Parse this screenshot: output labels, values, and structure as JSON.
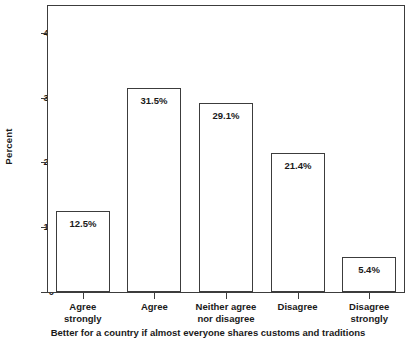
{
  "chart_data": {
    "type": "bar",
    "title": "",
    "subtitle": "",
    "categories": [
      "Agree strongly",
      "Agree",
      "Neither agree nor disagree",
      "Disagree",
      "Disagree strongly"
    ],
    "category_lines": [
      [
        "Agree",
        "strongly"
      ],
      [
        "Agree",
        ""
      ],
      [
        "Neither agree",
        "nor disagree"
      ],
      [
        "Disagree",
        ""
      ],
      [
        "Disagree",
        "strongly"
      ]
    ],
    "values": [
      12.5,
      31.5,
      29.1,
      21.4,
      5.4
    ],
    "value_labels": [
      "12.5%",
      "31.5%",
      "29.1%",
      "21.4%",
      "5.4%"
    ],
    "xlabel": "Better for a country if almost everyone shares customs and traditions",
    "ylabel": "Percent",
    "ylim": [
      0,
      44.3
    ],
    "yticks": [
      0,
      10,
      20,
      30,
      40
    ],
    "ytick_labels": [
      "0",
      "10",
      "20",
      "30",
      "40"
    ],
    "grid": false,
    "legend": false,
    "bar_fill_color": "#ffffff",
    "bar_edge_color": "#3c3c3c",
    "axis_color": "#3c3c3c",
    "text_color": "#1a1a1a",
    "background_color": "#ffffff"
  },
  "axes": {
    "y_title": "Percent"
  },
  "caption": {
    "text": "Better for a country if almost everyone shares customs and traditions"
  }
}
